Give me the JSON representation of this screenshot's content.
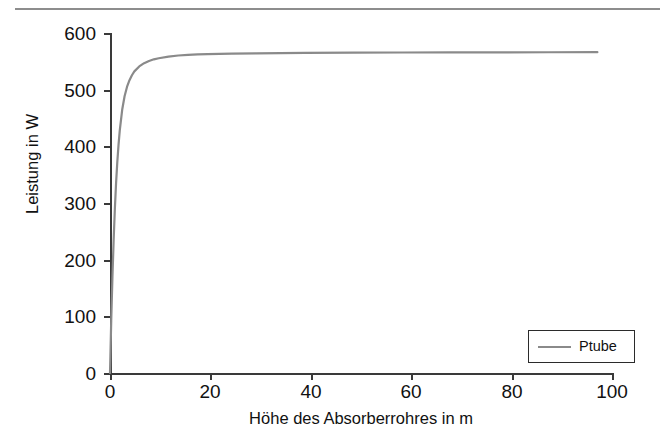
{
  "figure": {
    "background_color": "#ffffff",
    "top_rule_color": "#8d8d8d",
    "axis_color": "#3a3a3a"
  },
  "axes": {
    "xlabel": "Höhe des Absorberrohres in m",
    "ylabel": "Leistung in W",
    "x_ticks": [
      "0",
      "20",
      "40",
      "60",
      "80",
      "100"
    ],
    "y_ticks": [
      "0",
      "100",
      "200",
      "300",
      "400",
      "500",
      "600"
    ]
  },
  "legend": {
    "entries": [
      {
        "label": "Ptube",
        "color": "#8a8a8a"
      }
    ],
    "position": "lower-right"
  },
  "chart_data": {
    "type": "line",
    "title": "",
    "subtitle": "",
    "xlabel": "Höhe des Absorberrohres in m",
    "ylabel": "Leistung in W",
    "xlim": [
      0,
      103
    ],
    "ylim": [
      0,
      620
    ],
    "xticks": [
      0,
      20,
      40,
      60,
      80,
      100
    ],
    "yticks": [
      0,
      100,
      200,
      300,
      400,
      500,
      600
    ],
    "grid": false,
    "legend_position": "lower right",
    "series": [
      {
        "name": "Ptube",
        "color": "#8a8a8a",
        "linewidth": 2.2,
        "x": [
          0,
          0.25,
          0.5,
          0.75,
          1,
          1.25,
          1.5,
          1.75,
          2,
          2.5,
          3,
          3.5,
          4,
          4.5,
          5,
          6,
          7,
          8,
          9,
          10,
          12,
          14,
          16,
          18,
          20,
          25,
          30,
          35,
          40,
          50,
          60,
          70,
          80,
          90,
          100
        ],
        "y": [
          0,
          95,
          175,
          243,
          300,
          347,
          385,
          416,
          442,
          480,
          505,
          522,
          534,
          543,
          550,
          559,
          565,
          569,
          572,
          574,
          577,
          579,
          580,
          581,
          581.5,
          582.5,
          583,
          583.4,
          583.7,
          584.1,
          584.4,
          584.6,
          584.8,
          584.9,
          585
        ],
        "annotation": "Saturation curve: power rises steeply from 0 W and plateaus near 585 W"
      }
    ]
  }
}
